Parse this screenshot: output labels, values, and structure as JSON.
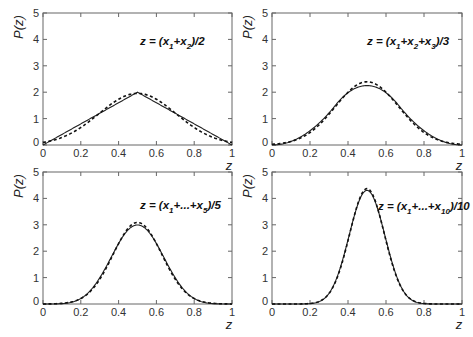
{
  "chart_data": [
    {
      "type": "line",
      "panel": "top-left",
      "annotation": "z = (x1+x2)/2",
      "annotation_parts": [
        "z = (x",
        "1",
        "+x",
        "2",
        ")/2"
      ],
      "xlabel": "z",
      "ylabel": "P(z)",
      "xlim": [
        0,
        1
      ],
      "ylim": [
        0,
        5
      ],
      "xticks": [
        "0",
        "0.2",
        "0.4",
        "0.6",
        "0.8",
        "1"
      ],
      "yticks": [
        "0",
        "1",
        "2",
        "3",
        "4",
        "5"
      ],
      "n": 2,
      "series": [
        {
          "name": "exact",
          "style": "solid",
          "x": [
            0,
            0.1,
            0.2,
            0.3,
            0.4,
            0.5,
            0.6,
            0.7,
            0.8,
            0.9,
            1.0
          ],
          "values": [
            0,
            0.4,
            0.8,
            1.2,
            1.6,
            2.0,
            1.6,
            1.2,
            0.8,
            0.4,
            0
          ]
        },
        {
          "name": "gaussian",
          "style": "dashed",
          "x": [
            0,
            0.1,
            0.2,
            0.3,
            0.4,
            0.5,
            0.6,
            0.7,
            0.8,
            0.9,
            1.0
          ],
          "values": [
            0.09,
            0.28,
            0.66,
            1.21,
            1.73,
            1.95,
            1.73,
            1.21,
            0.66,
            0.28,
            0.09
          ]
        }
      ]
    },
    {
      "type": "line",
      "panel": "top-right",
      "annotation": "z = (x1+x2+x3)/3",
      "annotation_parts": [
        "z = (x",
        "1",
        "+x",
        "2",
        "+x",
        "3",
        ")/3"
      ],
      "xlabel": "z",
      "ylabel": "P(z)",
      "xlim": [
        0,
        1
      ],
      "ylim": [
        0,
        5
      ],
      "xticks": [
        "0",
        "0.2",
        "0.4",
        "0.6",
        "0.8",
        "1"
      ],
      "yticks": [
        "0",
        "1",
        "2",
        "3",
        "4",
        "5"
      ],
      "n": 3,
      "series": [
        {
          "name": "exact",
          "style": "solid",
          "x": [
            0,
            0.1,
            0.2,
            0.3,
            0.4,
            0.5,
            0.6,
            0.7,
            0.8,
            0.9,
            1.0
          ],
          "values": [
            0,
            0.14,
            0.54,
            1.22,
            1.96,
            2.25,
            1.96,
            1.22,
            0.54,
            0.14,
            0
          ]
        },
        {
          "name": "gaussian",
          "style": "dashed",
          "x": [
            0,
            0.1,
            0.2,
            0.3,
            0.4,
            0.5,
            0.6,
            0.7,
            0.8,
            0.9,
            1.0
          ],
          "values": [
            0.02,
            0.11,
            0.48,
            1.3,
            2.1,
            2.39,
            2.1,
            1.3,
            0.48,
            0.11,
            0.02
          ]
        }
      ]
    },
    {
      "type": "line",
      "panel": "bottom-left",
      "annotation": "z = (x1+...+x5)/5",
      "annotation_parts": [
        "z = (x",
        "1",
        "+...+x",
        "5",
        ")/5"
      ],
      "xlabel": "z",
      "ylabel": "P(z)",
      "xlim": [
        0,
        1
      ],
      "ylim": [
        0,
        5
      ],
      "xticks": [
        "0",
        "0.2",
        "0.4",
        "0.6",
        "0.8",
        "1"
      ],
      "yticks": [
        "0",
        "1",
        "2",
        "3",
        "4",
        "5"
      ],
      "n": 5,
      "series": [
        {
          "name": "exact",
          "style": "solid",
          "x": [
            0,
            0.1,
            0.2,
            0.3,
            0.4,
            0.5,
            0.6,
            0.7,
            0.8,
            0.9,
            1.0
          ],
          "values": [
            0,
            0.01,
            0.16,
            0.81,
            2.03,
            2.88,
            2.03,
            0.81,
            0.16,
            0.01,
            0
          ]
        },
        {
          "name": "gaussian",
          "style": "dashed",
          "x": [
            0,
            0.1,
            0.2,
            0.3,
            0.4,
            0.5,
            0.6,
            0.7,
            0.8,
            0.9,
            1.0
          ],
          "values": [
            0,
            0.02,
            0.2,
            0.84,
            2.07,
            3.09,
            2.07,
            0.84,
            0.2,
            0.02,
            0
          ]
        }
      ]
    },
    {
      "type": "line",
      "panel": "bottom-right",
      "annotation": "z = (x1+...+x10)/10",
      "annotation_parts": [
        "z = (x",
        "1",
        "+...+x",
        "10",
        ")/10"
      ],
      "xlabel": "z",
      "ylabel": "P(z)",
      "xlim": [
        0,
        1
      ],
      "ylim": [
        0,
        5
      ],
      "xticks": [
        "0",
        "0.2",
        "0.4",
        "0.6",
        "0.8",
        "1"
      ],
      "yticks": [
        "0",
        "1",
        "2",
        "3",
        "4",
        "5"
      ],
      "n": 10,
      "series": [
        {
          "name": "exact",
          "style": "solid",
          "x": [
            0,
            0.1,
            0.2,
            0.3,
            0.4,
            0.5,
            0.6,
            0.7,
            0.8,
            0.9,
            1.0
          ],
          "values": [
            0,
            0,
            0.01,
            0.4,
            2.52,
            4.31,
            2.52,
            0.4,
            0.01,
            0,
            0
          ]
        },
        {
          "name": "gaussian",
          "style": "dashed",
          "x": [
            0,
            0.1,
            0.2,
            0.3,
            0.4,
            0.5,
            0.6,
            0.7,
            0.8,
            0.9,
            1.0
          ],
          "values": [
            0,
            0,
            0.02,
            0.4,
            2.57,
            4.37,
            2.57,
            0.4,
            0.02,
            0,
            0
          ]
        }
      ]
    }
  ],
  "layout": {
    "panels": [
      {
        "x0": 43,
        "x1": 232,
        "y0": 13,
        "y1": 145
      },
      {
        "x0": 272,
        "x1": 462,
        "y0": 13,
        "y1": 145
      },
      {
        "x0": 43,
        "x1": 232,
        "y0": 172,
        "y1": 304
      },
      {
        "x0": 272,
        "x1": 462,
        "y0": 172,
        "y1": 304
      }
    ],
    "annotation_pos": [
      {
        "x": 140,
        "y": 45
      },
      {
        "x": 367,
        "y": 45
      },
      {
        "x": 140,
        "y": 209
      },
      {
        "x": 378,
        "y": 210
      }
    ]
  }
}
